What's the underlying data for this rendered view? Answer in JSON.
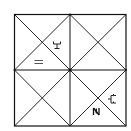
{
  "puzzle": {
    "type": "square grid with diagonals",
    "grid_size": [
      2,
      2
    ],
    "line_color": "#111111",
    "background_color": "#ffffff",
    "center_marker": true,
    "symbols": [
      {
        "name": "trident-glyph",
        "cell": "top-left",
        "region": "right-triangle",
        "glyph": "Y-with-base"
      },
      {
        "name": "equals-glyph",
        "cell": "top-left",
        "region": "bottom-triangle",
        "glyph": "="
      },
      {
        "name": "branch-glyph",
        "cell": "bottom-right",
        "region": "right-triangle",
        "glyph": "double-hook"
      },
      {
        "name": "n-glyph",
        "cell": "bottom-right",
        "region": "bottom-triangle",
        "glyph": "N"
      }
    ]
  }
}
